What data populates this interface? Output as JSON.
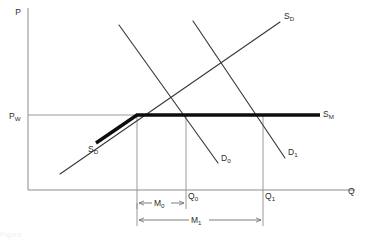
{
  "figure": {
    "kind": "economics-supply-demand-diagram",
    "background_color": "#ffffff",
    "axes": {
      "y_label": "P",
      "x_label": "Q",
      "axis_color": "#8c8c8c",
      "origin_px": [
        28,
        190
      ],
      "y_top_px": 8,
      "x_right_px": 355
    },
    "price_level": {
      "label_main": "P",
      "label_sub": "W",
      "y_px": 115,
      "line_color": "#9a9a9a"
    },
    "quantities": [
      {
        "label_main": "Q",
        "label_sub": "0",
        "x_px": 186,
        "text_x": 188,
        "text_y": 198
      },
      {
        "label_main": "Q",
        "label_sub": "1",
        "x_px": 263,
        "text_x": 265,
        "text_y": 198
      }
    ],
    "curves": [
      {
        "name": "domestic-supply-thick",
        "label_main": "S",
        "label_sub": "D",
        "label_x": 88,
        "label_y": 152,
        "style": "thick",
        "color": "#0d0d0d",
        "points": "96,143 137,115"
      },
      {
        "name": "world-supply-thick",
        "label_main": "S",
        "label_sub": "M",
        "label_x": 323,
        "label_y": 117,
        "style": "thick",
        "color": "#0d0d0d",
        "points": "137,115 320,115"
      },
      {
        "name": "domestic-supply-thin",
        "label_main": "S",
        "label_sub": "D",
        "label_x": 284,
        "label_y": 19,
        "style": "thin",
        "color": "#3a3a3a",
        "points": "60,174 280,22"
      },
      {
        "name": "demand-0",
        "label_main": "D",
        "label_sub": "0",
        "label_x": 221,
        "label_y": 161,
        "style": "thin",
        "color": "#3a3a3a",
        "points": "119,25 218,163"
      },
      {
        "name": "demand-1",
        "label_main": "D",
        "label_sub": "1",
        "label_x": 288,
        "label_y": 155,
        "style": "thin",
        "color": "#3a3a3a",
        "points": "193,21 285,158"
      }
    ],
    "drop_lines": [
      {
        "name": "dropline-qs",
        "x_px": 137,
        "y_top": 115,
        "y_bottom": 190
      },
      {
        "name": "dropline-q0",
        "x_px": 186,
        "y_top": 115,
        "y_bottom": 190
      },
      {
        "name": "dropline-q1",
        "x_px": 263,
        "y_top": 115,
        "y_bottom": 190
      }
    ],
    "dimensions": [
      {
        "name": "imports-m0",
        "label_main": "M",
        "label_sub": "0",
        "y_px": 203,
        "x_start": 137,
        "x_end": 186,
        "label_x": 155,
        "label_y": 206,
        "tick_top": 190,
        "tick_bottom": 209
      },
      {
        "name": "imports-m1",
        "label_main": "M",
        "label_sub": "1",
        "y_px": 220,
        "x_start": 137,
        "x_end": 263,
        "label_x": 193,
        "label_y": 223,
        "tick_top": 203,
        "tick_bottom": 226
      }
    ],
    "caption_faint": "Figure"
  }
}
